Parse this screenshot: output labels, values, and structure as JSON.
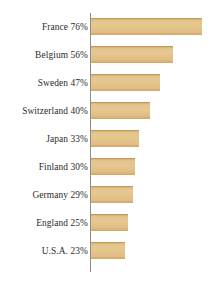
{
  "chart_data": {
    "type": "bar",
    "orientation": "horizontal",
    "title": "",
    "subtitle": "",
    "xlabel": "",
    "ylabel": "",
    "xlim": [
      0,
      80
    ],
    "ylim": null,
    "grid": false,
    "legend": null,
    "legend_position": "none",
    "value_unit": "%",
    "axis_line": "vertical-left",
    "categories": [
      "France",
      "Belgium",
      "Sweden",
      "Switzerland",
      "Japan",
      "Finland",
      "Germany",
      "England",
      "U.S.A."
    ],
    "values": [
      76,
      56,
      47,
      40,
      33,
      30,
      29,
      25,
      23
    ],
    "tick_labels": [
      "France 76%",
      "Belgium 56%",
      "Sweden 47%",
      "Switzerland 40%",
      "Japan 33%",
      "Finland 30%",
      "Germany 29%",
      "England 25%",
      "U.S.A. 23%"
    ],
    "colors": {
      "bar": "#E0BC80",
      "bar_highlight": "#E5C68F",
      "bar_shadow": "#D2A767",
      "axis": "#8D8D8D",
      "label_text": "#2B2B2B",
      "background": "#FFFFFF"
    }
  },
  "bars": [
    {
      "label": "France 76%",
      "name": "France",
      "value": 76
    },
    {
      "label": "Belgium 56%",
      "name": "Belgium",
      "value": 56
    },
    {
      "label": "Sweden 47%",
      "name": "Sweden",
      "value": 47
    },
    {
      "label": "Switzerland 40%",
      "name": "Switzerland",
      "value": 40
    },
    {
      "label": "Japan 33%",
      "name": "Japan",
      "value": 33
    },
    {
      "label": "Finland 30%",
      "name": "Finland",
      "value": 30
    },
    {
      "label": "Germany 29%",
      "name": "Germany",
      "value": 29
    },
    {
      "label": "England 25%",
      "name": "England",
      "value": 25
    },
    {
      "label": "U.S.A. 23%",
      "name": "U.S.A.",
      "value": 23
    }
  ]
}
